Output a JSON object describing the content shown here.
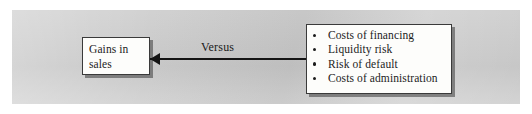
{
  "figure": {
    "type": "versus-comparison-diagram",
    "panel_color": "#c9c9c9",
    "box_fill_color": "#fdfdfb",
    "line_color": "#141414"
  },
  "left_node": {
    "label": "Gains in sales"
  },
  "connector": {
    "label": "Versus",
    "style": "double-headed-arrow",
    "left_arrowhead": "arrowhead-left-icon",
    "right_arrowhead": "arrowhead-right-icon"
  },
  "right_node": {
    "bullet_glyph": "bullet-icon",
    "items": [
      {
        "label": "Costs of financing"
      },
      {
        "label": "Liquidity risk"
      },
      {
        "label": "Risk of default"
      },
      {
        "label": "Costs of administration"
      }
    ]
  }
}
